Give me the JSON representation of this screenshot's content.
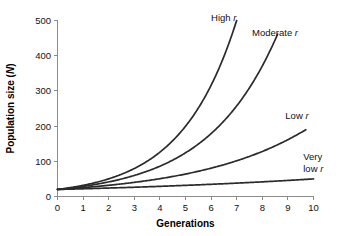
{
  "chart_data": {
    "type": "line",
    "title": "",
    "subtitle": "",
    "xlabel": "Generations",
    "ylabel": "Population size (N)",
    "ylabel_text": "Population size (",
    "ylabel_italic": "N",
    "ylabel_suffix": ")",
    "xlim": [
      0,
      10
    ],
    "ylim": [
      0,
      500
    ],
    "xticks": [
      0,
      1,
      2,
      3,
      4,
      5,
      6,
      7,
      8,
      9,
      10
    ],
    "xtick_labels": [
      "0",
      "1",
      "2",
      "3",
      "4",
      "5",
      "6",
      "7",
      "8",
      "9",
      "10"
    ],
    "yticks": [
      0,
      100,
      200,
      300,
      400,
      500
    ],
    "ytick_labels": [
      "0",
      "100",
      "200",
      "300",
      "400",
      "500"
    ],
    "grid": false,
    "legend_position": "inline-end-of-curve",
    "initial_population": 20,
    "curve_color": "#2b2b2b",
    "axis_color": "#8c8c8c",
    "series": [
      {
        "name": "High r",
        "label_prefix": "High ",
        "label_italic": "r",
        "label_line2": "",
        "growth_rate": 0.46,
        "x_end": 7.0,
        "x": [
          0,
          1,
          2,
          3,
          4,
          5,
          6,
          7
        ],
        "values": [
          20,
          32,
          50,
          79,
          126,
          199,
          316,
          500
        ],
        "label_x": 6.0,
        "label_y": 500
      },
      {
        "name": "Moderate r",
        "label_prefix": "Moderate ",
        "label_italic": "r",
        "label_line2": "",
        "growth_rate": 0.365,
        "x_end": 8.6,
        "x": [
          0,
          1,
          2,
          3,
          4,
          5,
          6,
          7,
          8,
          8.6
        ],
        "values": [
          20,
          29,
          41,
          60,
          86,
          124,
          178,
          256,
          369,
          460
        ],
        "label_x": 7.6,
        "label_y": 455
      },
      {
        "name": "Low r",
        "label_prefix": "Low ",
        "label_italic": "r",
        "label_line2": "",
        "growth_rate": 0.232,
        "x_end": 9.7,
        "x": [
          0,
          1,
          2,
          3,
          4,
          5,
          6,
          7,
          8,
          9,
          9.7
        ],
        "values": [
          20,
          25,
          32,
          40,
          51,
          64,
          80,
          101,
          128,
          161,
          190
        ],
        "label_x": 8.9,
        "label_y": 220
      },
      {
        "name": "Very low r",
        "label_prefix": "Very",
        "label_italic": "r",
        "label_line2": "low ",
        "growth_rate": 0.0916,
        "x_end": 10.0,
        "x": [
          0,
          1,
          2,
          3,
          4,
          5,
          6,
          7,
          8,
          9,
          10
        ],
        "values": [
          20,
          22,
          24,
          26,
          29,
          32,
          35,
          38,
          42,
          45,
          50
        ],
        "label_x": 9.6,
        "label_y": 105
      }
    ]
  }
}
